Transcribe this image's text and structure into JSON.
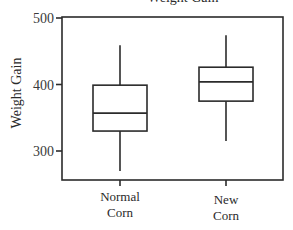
{
  "chart_data": {
    "type": "boxplot",
    "title": "Weight Gain",
    "xlabel": "",
    "ylabel": "Weight Gain",
    "ylim": [
      260,
      502
    ],
    "yticks": [
      300,
      400,
      500
    ],
    "ytick_labels": [
      "300",
      "400",
      "500"
    ],
    "grid": false,
    "categories": [
      {
        "line1": "Normal",
        "line2": "Corn"
      },
      {
        "line1": "New",
        "line2": "Corn"
      }
    ],
    "boxes": [
      {
        "name": "Normal Corn",
        "whisker_low": 270,
        "q1": 330,
        "median": 357,
        "q3": 399,
        "whisker_high": 459
      },
      {
        "name": "New Corn",
        "whisker_low": 315,
        "q1": 375,
        "median": 404,
        "q3": 426,
        "whisker_high": 474
      }
    ]
  }
}
